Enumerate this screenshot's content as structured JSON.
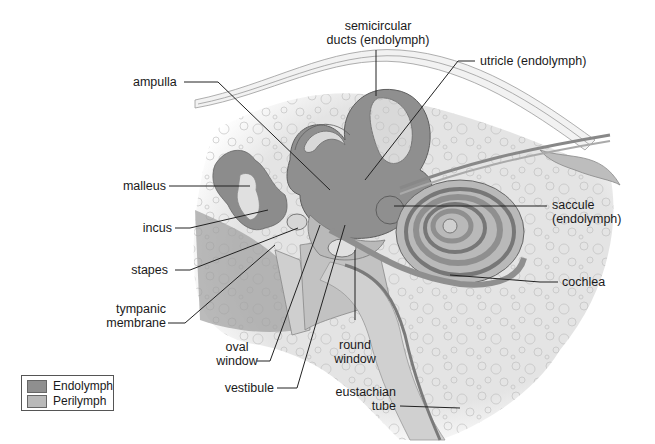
{
  "diagram": {
    "colors": {
      "endolymph": "#8f8f8f",
      "perilymph": "#b9b9b9",
      "bone": "#e6e6e6",
      "ossicle": "#d8d8d8",
      "leader_line": "#222222"
    },
    "labels": {
      "semicircular_ducts": [
        "semicircular",
        "ducts (endolymph)"
      ],
      "ampulla": "ampulla",
      "utricle": "utricle (endolymph)",
      "malleus": "malleus",
      "incus": "incus",
      "saccule": [
        "saccule",
        "(endolymph)"
      ],
      "stapes": "stapes",
      "cochlea": "cochlea",
      "tympanic_membrane": [
        "tympanic",
        "membrane"
      ],
      "oval_window": [
        "oval",
        "window"
      ],
      "round_window": [
        "round",
        "window"
      ],
      "vestibule": "vestibule",
      "eustachian_tube": [
        "eustachian",
        "tube"
      ]
    },
    "legend": [
      {
        "label": "Endolymph",
        "color": "#8f8f8f"
      },
      {
        "label": "Perilymph",
        "color": "#b9b9b9"
      }
    ]
  }
}
